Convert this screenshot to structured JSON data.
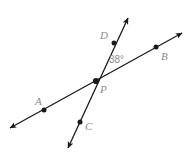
{
  "figure": {
    "type": "geometry-diagram",
    "width": 191,
    "height": 159,
    "background_color": "#ffffff",
    "line_color": "#1a1a1a",
    "label_color": "#8a8a8a",
    "lines": [
      {
        "name": "line-ab",
        "points": [
          "A",
          "P",
          "B"
        ],
        "start": [
          10,
          128
        ],
        "end": [
          182,
          33
        ],
        "arrow_start": true,
        "arrow_end": true
      },
      {
        "name": "line-cd",
        "points": [
          "C",
          "P",
          "D"
        ],
        "start": [
          68,
          148
        ],
        "end": [
          128,
          18
        ],
        "arrow_start": true,
        "arrow_end": true
      }
    ],
    "points": [
      {
        "id": "A",
        "label": "A",
        "dot": [
          44,
          110
        ],
        "label_pos": [
          35,
          96
        ]
      },
      {
        "id": "B",
        "label": "B",
        "dot": [
          156,
          47
        ],
        "label_pos": [
          161,
          51
        ]
      },
      {
        "id": "C",
        "label": "C",
        "dot": [
          80,
          122
        ],
        "label_pos": [
          85,
          121
        ]
      },
      {
        "id": "D",
        "label": "D",
        "dot": [
          114,
          43
        ],
        "label_pos": [
          100,
          30
        ]
      },
      {
        "id": "P",
        "label": "P",
        "dot": [
          96,
          81
        ],
        "label_pos": [
          100,
          84
        ]
      }
    ],
    "angles": [
      {
        "id": "angle-dpb",
        "label": "38°",
        "value": 38,
        "unit": "degrees",
        "vertex": "P",
        "between": [
          "D",
          "B"
        ],
        "label_pos": [
          109,
          55
        ]
      }
    ]
  }
}
